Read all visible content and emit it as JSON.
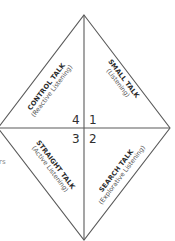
{
  "diagram": {
    "quadrants": [
      {
        "number": "1",
        "title": "SMALL TALK",
        "subtitle": "(Listening)",
        "position": "top-right"
      },
      {
        "number": "2",
        "title": "SEARCH TALK",
        "subtitle": "(Explorative Listening)",
        "position": "bottom-right"
      },
      {
        "number": "3",
        "title": "STRAIGHT TALK",
        "subtitle": "(Active Listening)",
        "position": "bottom-left"
      },
      {
        "number": "4",
        "title": "CONTROL TALK",
        "subtitle": "(Reactive Listening)",
        "position": "top-left"
      }
    ],
    "edge_text": "rs",
    "colors": {
      "line": "#555555",
      "text": "#2b2b2b",
      "subtext": "#555555"
    }
  }
}
